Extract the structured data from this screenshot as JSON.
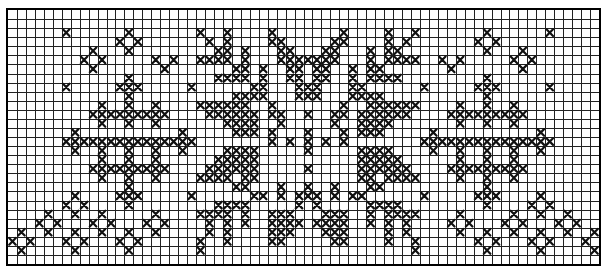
{
  "diagram": {
    "type": "cross-stitch-pattern-chart",
    "grid": {
      "columns": 66,
      "rows": 28
    },
    "colors": {
      "background": "#ffffff",
      "gridline": "#222222",
      "stitch": "#111111",
      "border": "#000000"
    },
    "legend": {
      "X": "cross stitch",
      ".": "empty cell"
    },
    "left_half_rows": [
      [],
      [],
      [
        6,
        13,
        21,
        24,
        29
      ],
      [
        12,
        14,
        22,
        24,
        29,
        30
      ],
      [
        9,
        13,
        23,
        24,
        26,
        30,
        31
      ],
      [
        8,
        10,
        16,
        18,
        21,
        22,
        23,
        24,
        26,
        30,
        31,
        32
      ],
      [
        9,
        17,
        25,
        26,
        28,
        31,
        32
      ],
      [
        13,
        23,
        24,
        25,
        26,
        28,
        31,
        32
      ],
      [
        6,
        12,
        13,
        14,
        20,
        27,
        28,
        32
      ],
      [
        13,
        25,
        26,
        27,
        28,
        32
      ],
      [
        10,
        13,
        16,
        21,
        22,
        23,
        24,
        25,
        26,
        29
      ],
      [
        9,
        10,
        11,
        12,
        13,
        14,
        15,
        16,
        17,
        22,
        23,
        24,
        25,
        26,
        27,
        29,
        30
      ],
      [
        10,
        13,
        16,
        24,
        25,
        26,
        27,
        30
      ],
      [
        7,
        19,
        25,
        26,
        27,
        29
      ],
      [
        6,
        7,
        8,
        9,
        10,
        11,
        12,
        13,
        14,
        15,
        16,
        17,
        18,
        19,
        20,
        29,
        31
      ],
      [
        7,
        10,
        13,
        16,
        19,
        24,
        25,
        26,
        27
      ],
      [
        10,
        13,
        16,
        23,
        24,
        25,
        26,
        27
      ],
      [
        9,
        10,
        11,
        12,
        13,
        14,
        15,
        16,
        17,
        22,
        23,
        24,
        25,
        26,
        27
      ],
      [
        10,
        13,
        16,
        21,
        22,
        23,
        24,
        26,
        27
      ],
      [
        13,
        25,
        26,
        30
      ],
      [
        7,
        12,
        13,
        14,
        20,
        27,
        28,
        30,
        32
      ],
      [
        6,
        8,
        13,
        23,
        24,
        25,
        26,
        32
      ],
      [
        4,
        7,
        10,
        16,
        21,
        22,
        23,
        24,
        26,
        29,
        30,
        31
      ],
      [
        3,
        5,
        9,
        11,
        15,
        17,
        22,
        24,
        26,
        29,
        30,
        31,
        32
      ],
      [
        1,
        4,
        7,
        10,
        13,
        16,
        22,
        24,
        29,
        30,
        31
      ],
      [
        0,
        2,
        6,
        8,
        12,
        14,
        21,
        24,
        29,
        30
      ],
      [
        1,
        7,
        13,
        21
      ],
      []
    ],
    "center_column": 33,
    "center_column_rows": [
      5,
      8,
      9,
      11,
      13,
      14,
      15,
      17,
      19,
      20
    ],
    "mirror_rule": "column c on left maps to column 66 - c on right"
  }
}
